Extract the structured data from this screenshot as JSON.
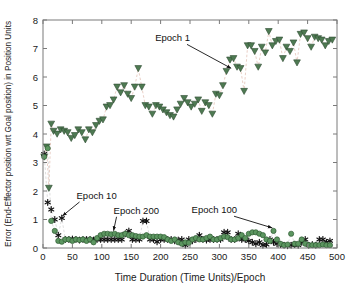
{
  "chart_data": {
    "type": "scatter",
    "title": "",
    "xlabel": "Time Duration (Time Units)/Epoch",
    "ylabel": "Error (End-Effector position wrt Goal position) in Position Units",
    "xlim": [
      0,
      500
    ],
    "ylim": [
      0,
      8
    ],
    "xticks": [
      0,
      50,
      100,
      150,
      200,
      250,
      300,
      350,
      400,
      450,
      500
    ],
    "yticks": [
      0,
      1,
      2,
      3,
      4,
      5,
      6,
      7,
      8
    ],
    "grid": false,
    "legend_position": "none",
    "annotations": [
      {
        "label": "Epoch 1",
        "text_x": 250,
        "text_y": 7.25,
        "point_x": 320,
        "point_y": 6.2
      },
      {
        "label": "Epoch 10",
        "text_x": 57,
        "text_y": 1.72,
        "point_x": 33,
        "point_y": 1.02
      },
      {
        "label": "Epoch 200",
        "text_x": 120,
        "text_y": 1.2,
        "point_x": 120,
        "point_y": 0.5
      },
      {
        "label": "Epoch 100",
        "text_x": 330,
        "text_y": 1.22,
        "point_x": 390,
        "point_y": 0.6
      }
    ],
    "series": [
      {
        "name": "Epoch 1",
        "marker": "triangle-down",
        "marker_color": "#4e7a52",
        "line_color": "#e7c9bf",
        "line_style": "dashed",
        "x": [
          2,
          6,
          10,
          14,
          18,
          24,
          30,
          36,
          42,
          48,
          54,
          60,
          66,
          72,
          78,
          84,
          90,
          96,
          102,
          108,
          114,
          120,
          126,
          132,
          138,
          144,
          150,
          156,
          162,
          168,
          174,
          180,
          186,
          192,
          198,
          204,
          210,
          216,
          222,
          228,
          234,
          240,
          246,
          252,
          258,
          264,
          270,
          276,
          282,
          288,
          294,
          300,
          306,
          312,
          318,
          324,
          330,
          336,
          342,
          348,
          354,
          360,
          366,
          372,
          378,
          384,
          390,
          396,
          402,
          408,
          414,
          420,
          426,
          432,
          438,
          444,
          450,
          456,
          462,
          468,
          474,
          480,
          486,
          492
        ],
        "y": [
          3.2,
          3.55,
          2.1,
          4.35,
          4.1,
          4.0,
          4.15,
          4.1,
          4.05,
          3.85,
          3.95,
          4.15,
          4.05,
          3.8,
          4.15,
          4.05,
          4.3,
          4.45,
          4.5,
          4.95,
          5.0,
          5.2,
          5.65,
          5.45,
          5.7,
          5.4,
          5.25,
          5.65,
          6.3,
          5.65,
          5.0,
          4.95,
          4.7,
          5.0,
          4.95,
          4.85,
          4.75,
          4.65,
          4.6,
          4.85,
          5.05,
          5.25,
          5.1,
          4.95,
          5.05,
          5.2,
          4.8,
          5.1,
          5.0,
          4.7,
          5.4,
          5.35,
          5.7,
          6.2,
          6.6,
          6.65,
          6.35,
          6.3,
          5.5,
          7.1,
          7.1,
          6.9,
          6.35,
          7.05,
          6.85,
          7.6,
          7.1,
          7.25,
          7.3,
          6.65,
          7.05,
          6.9,
          7.2,
          6.5,
          7.5,
          7.55,
          7.35,
          7.05,
          7.4,
          7.35,
          7.3,
          7.1,
          7.25,
          7.3
        ]
      },
      {
        "name": "Epoch 10",
        "marker": "star",
        "marker_color": "#111111",
        "line_color": "#cfcfcf",
        "line_style": "dashed",
        "x": [
          2,
          8,
          14,
          20,
          26,
          32,
          38,
          44,
          50,
          56,
          62,
          68,
          74,
          80,
          86,
          92,
          98,
          104,
          110,
          116,
          122,
          128,
          134,
          140,
          146,
          152,
          158,
          164,
          170,
          176,
          182,
          188,
          194,
          200,
          206,
          212,
          218,
          224,
          230,
          236,
          242,
          248,
          254,
          260,
          266,
          272,
          278,
          284,
          290,
          296,
          302,
          308,
          314,
          320,
          326,
          332,
          338,
          344,
          350,
          356,
          362,
          368,
          374,
          380,
          386,
          392,
          398,
          404,
          410,
          416,
          422,
          428,
          434,
          440,
          446,
          452,
          458,
          464,
          470,
          476,
          482,
          488
        ],
        "y": [
          3.3,
          1.6,
          1.35,
          1.0,
          0.45,
          1.05,
          0.3,
          0.3,
          0.32,
          0.3,
          0.28,
          0.3,
          0.3,
          0.3,
          0.28,
          0.3,
          0.3,
          0.3,
          0.3,
          0.3,
          0.3,
          0.3,
          0.3,
          0.5,
          0.6,
          0.3,
          0.3,
          0.3,
          0.95,
          0.95,
          0.3,
          0.3,
          0.22,
          0.3,
          0.3,
          0.3,
          0.3,
          0.25,
          0.28,
          0.3,
          0.1,
          0.3,
          0.25,
          0.3,
          0.45,
          0.3,
          0.28,
          0.3,
          0.3,
          0.3,
          0.3,
          0.55,
          0.55,
          0.3,
          0.3,
          0.5,
          0.3,
          0.3,
          0.25,
          0.2,
          0.15,
          0.2,
          0.1,
          0.12,
          0.3,
          0.2,
          0.15,
          0.12,
          0.1,
          0.08,
          0.1,
          0.12,
          0.1,
          0.2,
          0.3,
          0.1,
          0.12,
          0.1,
          0.3,
          0.3,
          0.2,
          0.25
        ]
      },
      {
        "name": "Epoch 100 / 200",
        "marker": "circle",
        "marker_color": "#5c9660",
        "line_color": "#cfcfcf",
        "line_style": "dashed",
        "x": [
          2,
          8,
          14,
          20,
          26,
          32,
          38,
          44,
          50,
          56,
          62,
          68,
          74,
          80,
          86,
          92,
          98,
          104,
          110,
          116,
          122,
          128,
          134,
          140,
          146,
          152,
          158,
          164,
          170,
          176,
          182,
          188,
          194,
          200,
          206,
          212,
          218,
          224,
          230,
          236,
          242,
          248,
          254,
          260,
          266,
          272,
          278,
          284,
          290,
          296,
          302,
          308,
          314,
          320,
          326,
          332,
          338,
          344,
          350,
          356,
          362,
          368,
          374,
          380,
          386,
          392,
          398,
          404,
          410,
          416,
          422,
          428,
          434,
          440,
          446,
          452,
          458,
          464,
          470,
          476,
          482,
          488
        ],
        "y": [
          3.2,
          3.5,
          0.95,
          0.6,
          0.25,
          0.22,
          0.3,
          0.3,
          0.25,
          0.3,
          0.28,
          0.3,
          0.25,
          0.3,
          0.2,
          0.35,
          0.45,
          0.5,
          0.5,
          0.48,
          0.5,
          0.45,
          0.45,
          0.5,
          0.45,
          0.45,
          0.42,
          0.4,
          0.4,
          0.45,
          0.4,
          0.4,
          0.4,
          0.4,
          0.38,
          0.3,
          0.25,
          0.3,
          0.2,
          0.15,
          0.2,
          0.18,
          0.3,
          0.35,
          0.3,
          0.3,
          0.35,
          0.4,
          0.3,
          0.3,
          0.35,
          0.4,
          0.38,
          0.3,
          0.3,
          0.35,
          0.45,
          0.35,
          0.5,
          0.55,
          0.55,
          0.5,
          0.45,
          0.3,
          0.25,
          0.6,
          0.3,
          0.15,
          0.1,
          0.12,
          0.5,
          0.15,
          0.15,
          0.3,
          0.15,
          0.1,
          0.1,
          0.1,
          0.1,
          0.12,
          0.1,
          0.1
        ]
      }
    ]
  }
}
